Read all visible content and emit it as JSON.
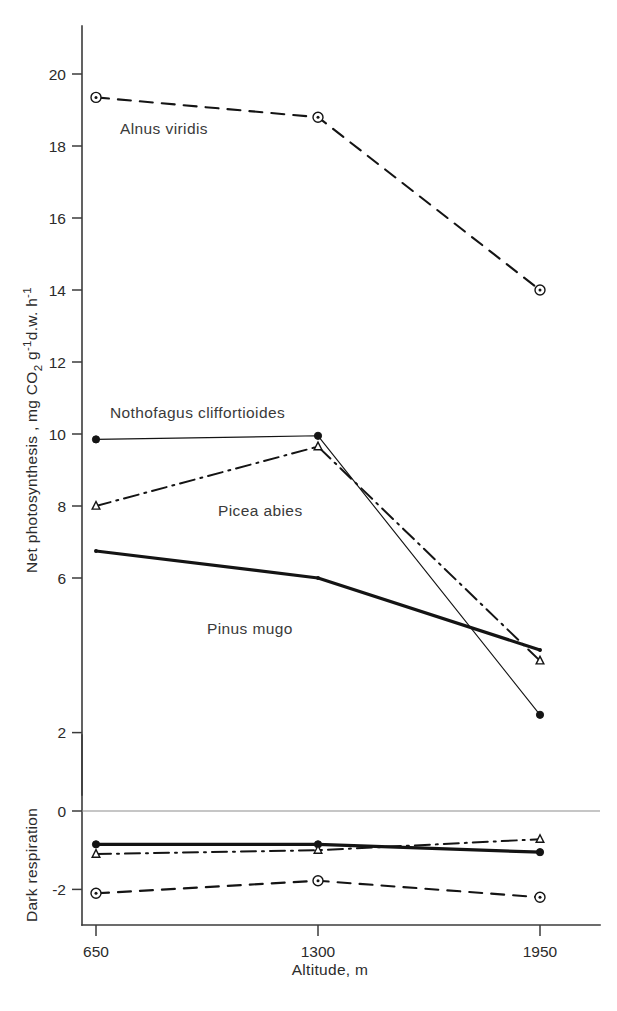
{
  "figure": {
    "width": 617,
    "height": 1011,
    "background": "#ffffff",
    "ink_color": "#141414"
  },
  "chart_data": {
    "type": "line",
    "title": "",
    "xlabel": "Altitude, m",
    "ylabel_top": "Net photosynthesis , mg CO₂ g⁻¹ d.w. h⁻¹",
    "ylabel_bottom": "Dark respiration",
    "x": [
      650,
      1300,
      1950
    ],
    "xtick_labels": [
      "650",
      "1300",
      "1950"
    ],
    "xlim": [
      650,
      1950
    ],
    "panels": [
      {
        "name": "net-photosynthesis",
        "ylim": [
          4.8,
          21.2
        ],
        "yticks": [
          6,
          8,
          10,
          12,
          14,
          16,
          18,
          20
        ],
        "ytick_labels": [
          "6",
          "8",
          "10",
          "12",
          "14",
          "16",
          "18",
          "20"
        ],
        "grid": false
      },
      {
        "name": "dark-respiration",
        "ylim": [
          -2.9,
          3.0
        ],
        "yticks": [
          2,
          0,
          -2
        ],
        "ytick_labels": [
          "2",
          "0",
          "-2"
        ],
        "grid": false,
        "zero_line": true
      }
    ],
    "legend_position": "inline-annotations",
    "series": [
      {
        "name": "Alnus viridis",
        "label": "Alnus viridis",
        "style": "dashed",
        "marker": "circle-dot",
        "net_photosynthesis": [
          19.35,
          18.8,
          14.0
        ],
        "dark_respiration": [
          -2.1,
          -1.78,
          -2.2
        ],
        "label_x": 1080,
        "label_y": 18.05
      },
      {
        "name": "Nothofagus cliffortioides",
        "label": "Nothofagus cliffortioides",
        "style": "thin-solid",
        "marker": "filled-circle",
        "net_photosynthesis": [
          9.85,
          9.95,
          2.2
        ],
        "dark_respiration": [
          -0.85,
          -0.85,
          -1.05
        ],
        "label_x": 1020,
        "label_y": 10.7
      },
      {
        "name": "Picea abies",
        "label": "Picea abies",
        "style": "dash-dot",
        "marker": "triangle",
        "net_photosynthesis": [
          8.0,
          9.65,
          3.7
        ],
        "dark_respiration": [
          -1.1,
          -1.0,
          -0.72
        ],
        "label_x": 1200,
        "label_y": 8.05
      },
      {
        "name": "Pinus mugo",
        "label": "Pinus mugo",
        "style": "thick-solid",
        "marker": "tiny-dot",
        "net_photosynthesis": [
          6.75,
          6.0,
          4.0
        ],
        "dark_respiration": [
          -0.85,
          -0.85,
          -1.05
        ],
        "label_x": 1120,
        "label_y": 5.3
      }
    ]
  }
}
